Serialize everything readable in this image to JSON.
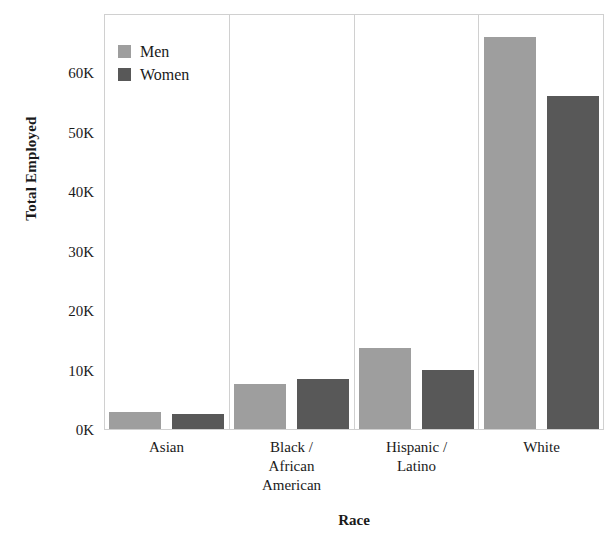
{
  "chart_data": {
    "type": "bar",
    "title": "",
    "xlabel": "Race",
    "ylabel": "Total Employed",
    "categories": [
      "Asian",
      "Black /\nAfrican\nAmerican",
      "Hispanic /\nLatino",
      "White"
    ],
    "series": [
      {
        "name": "Men",
        "color": "#9e9e9e",
        "values": [
          2900,
          7500,
          13700,
          66000
        ]
      },
      {
        "name": "Women",
        "color": "#585858",
        "values": [
          2500,
          8500,
          10000,
          56000
        ]
      }
    ],
    "ylim": [
      0,
      70000
    ],
    "ytick_values": [
      0,
      10000,
      20000,
      30000,
      40000,
      50000,
      60000
    ],
    "ytick_labels": [
      "0K",
      "10K",
      "20K",
      "30K",
      "40K",
      "50K",
      "60K"
    ],
    "grid": false,
    "faceted": true,
    "legend_position": "top-left-inside"
  },
  "axes": {
    "y_title": "Total Employed",
    "x_title": "Race"
  },
  "legend": {
    "entries": [
      {
        "label": "Men",
        "color": "#9e9e9e"
      },
      {
        "label": "Women",
        "color": "#585858"
      }
    ]
  },
  "ticks": {
    "y": [
      {
        "label": "60K",
        "value": 60000
      },
      {
        "label": "50K",
        "value": 50000
      },
      {
        "label": "40K",
        "value": 40000
      },
      {
        "label": "30K",
        "value": 30000
      },
      {
        "label": "20K",
        "value": 20000
      },
      {
        "label": "10K",
        "value": 10000
      },
      {
        "label": "0K",
        "value": 0
      }
    ]
  },
  "panels": [
    {
      "label": "Asian",
      "men": 2900,
      "women": 2500
    },
    {
      "label": "Black /\nAfrican\nAmerican",
      "men": 7500,
      "women": 8500
    },
    {
      "label": "Hispanic /\nLatino",
      "men": 13700,
      "women": 10000
    },
    {
      "label": "White",
      "men": 66000,
      "women": 56000
    }
  ]
}
